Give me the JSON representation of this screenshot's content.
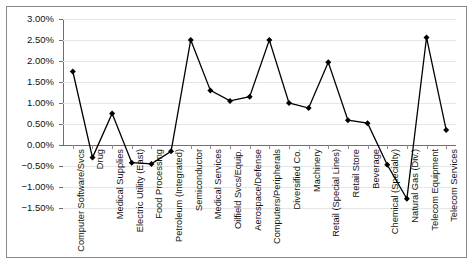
{
  "chart_data": {
    "type": "line",
    "title": "",
    "subtitle": "",
    "xlabel": "",
    "ylabel": "",
    "ylim": [
      -1.75,
      3.0
    ],
    "yticks": [
      "3.00%",
      "2.50%",
      "2.00%",
      "1.50%",
      "1.00%",
      "0.50%",
      "0.00%",
      "-0.50%",
      "-1.00%",
      "-1.50%"
    ],
    "ytick_values": [
      3.0,
      2.5,
      2.0,
      1.5,
      1.0,
      0.5,
      0.0,
      -0.5,
      -1.0,
      -1.5
    ],
    "grid": true,
    "legend": "none",
    "units": "percent",
    "marker": "diamond",
    "line_color": "#000000",
    "marker_color": "#000000",
    "grid_color": "#e6e6e6",
    "axis_color": "#6f6f6f",
    "categories": [
      "Computer Software/Svcs",
      "Drug",
      "Medical Supplies",
      "Electric Utility (East)",
      "Food Processing",
      "Petroleum (Integrated)",
      "Semiconductor",
      "Medical Services",
      "Oilfield Svcs/Equip.",
      "Aerospace/Defense",
      "Computers/Peripherals",
      "Diversified Co.",
      "Machinery",
      "Retail (Special Lines)",
      "Retail Store",
      "Beverage",
      "Chemical (Specialty)",
      "Natural Gas (Div.)",
      "Telecom Equipment",
      "Telecom Services"
    ],
    "values": [
      1.75,
      -0.3,
      0.75,
      -0.42,
      -0.45,
      -0.15,
      2.5,
      1.3,
      1.05,
      1.15,
      2.5,
      1.0,
      0.88,
      1.97,
      0.59,
      0.52,
      -0.47,
      -1.28,
      2.56,
      0.36
    ]
  }
}
